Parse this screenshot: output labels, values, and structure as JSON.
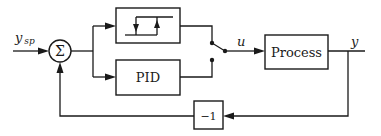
{
  "diagram": {
    "type": "block-diagram",
    "title": "",
    "signals": {
      "setpoint": {
        "label_main": "y",
        "label_sub": "sp"
      },
      "control": {
        "label": "u"
      },
      "output": {
        "label": "y"
      }
    },
    "blocks": {
      "summer": {
        "symbol": "Σ"
      },
      "relay": {
        "label": "",
        "icon": "relay-hysteresis-icon"
      },
      "pid": {
        "label": "PID"
      },
      "switch": {
        "label": "",
        "icon": "switch-icon"
      },
      "process": {
        "label": "Process"
      },
      "gain": {
        "label": "−1"
      }
    },
    "connections": [
      {
        "from": "y_sp",
        "to": "summer"
      },
      {
        "from": "summer",
        "to": "relay"
      },
      {
        "from": "summer",
        "to": "pid"
      },
      {
        "from": "relay",
        "to": "switch"
      },
      {
        "from": "pid",
        "to": "switch"
      },
      {
        "from": "switch",
        "to": "process",
        "signal": "u"
      },
      {
        "from": "process",
        "to": "output",
        "signal": "y"
      },
      {
        "from": "output",
        "to": "gain"
      },
      {
        "from": "gain",
        "to": "summer"
      }
    ],
    "colors": {
      "stroke": "#1a1a1a",
      "background": "#ffffff"
    }
  }
}
